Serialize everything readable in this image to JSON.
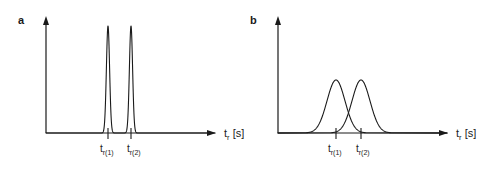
{
  "figure": {
    "width": 502,
    "height": 172,
    "background_color": "#ffffff",
    "line_color": "#1a1a1a"
  },
  "panels": [
    {
      "letter": "a",
      "letter_x": 18,
      "letter_y": 24,
      "origin_x": 46,
      "baseline_y": 133,
      "axis_top_y": 18,
      "axis_right_x": 215,
      "xlabel_main": "t",
      "xlabel_sub": "r",
      "xlabel_unit": "[s]",
      "xlabel_x": 224,
      "xlabel_y": 137,
      "ticks": [
        {
          "label_main": "t",
          "label_sub": "r(1)",
          "x": 108
        },
        {
          "label_main": "t",
          "label_sub": "r(2)",
          "x": 131
        }
      ],
      "tick_label_y": 152
    },
    {
      "letter": "b",
      "letter_x": 250,
      "letter_y": 24,
      "origin_x": 278,
      "baseline_y": 133,
      "axis_top_y": 18,
      "axis_right_x": 447,
      "xlabel_main": "t",
      "xlabel_sub": "r",
      "xlabel_unit": "[s]",
      "xlabel_x": 456,
      "xlabel_y": 137,
      "ticks": [
        {
          "label_main": "t",
          "label_sub": "r(1)",
          "x": 336
        },
        {
          "label_main": "t",
          "label_sub": "r(2)",
          "x": 361
        }
      ],
      "tick_label_y": 152
    }
  ],
  "chart_data": {
    "type": "line",
    "title": "",
    "subtitle": "",
    "xlabel": "t_r [s]",
    "ylabel": "",
    "grid": false,
    "legend": "none",
    "panels": [
      {
        "panel": "a",
        "xlim": [
          46,
          215
        ],
        "ylim": [
          133,
          18
        ],
        "baseline_value": 133,
        "peaks": [
          {
            "name": "t_r(1)",
            "center": 108,
            "sigma": 1.6,
            "amplitude": 107,
            "apex_y": 26
          },
          {
            "name": "t_r(2)",
            "center": 131,
            "sigma": 1.6,
            "amplitude": 107,
            "apex_y": 26
          }
        ]
      },
      {
        "panel": "b",
        "xlim": [
          278,
          447
        ],
        "ylim": [
          133,
          18
        ],
        "baseline_value": 133,
        "peaks": [
          {
            "name": "t_r(1)",
            "center": 336,
            "sigma": 9.0,
            "amplitude": 53,
            "apex_y": 80
          },
          {
            "name": "t_r(2)",
            "center": 361,
            "sigma": 9.0,
            "amplitude": 53,
            "apex_y": 80
          }
        ]
      }
    ]
  }
}
